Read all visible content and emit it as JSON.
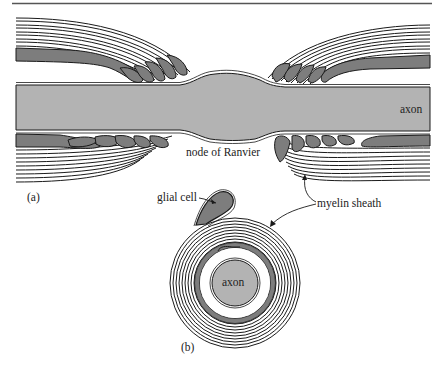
{
  "figure": {
    "panels": [
      {
        "id": "a",
        "label": "(a)",
        "description": "Longitudinal section of myelinated axon at a node of Ranvier"
      },
      {
        "id": "b",
        "label": "(b)",
        "description": "Cross section of axon wrapped by glial cell forming myelin sheath"
      }
    ],
    "labels": {
      "axon_a": "axon",
      "node": "node of Ranvier",
      "glial_cell": "glial cell",
      "myelin_sheath": "myelin sheath",
      "axon_b": "axon",
      "panel_a": "(a)",
      "panel_b": "(b)"
    },
    "colors": {
      "axon_fill": "#b3b3b3",
      "glial_cytoplasm": "#7d7d7d",
      "line": "#1a1a1a",
      "background": "#ffffff"
    }
  }
}
